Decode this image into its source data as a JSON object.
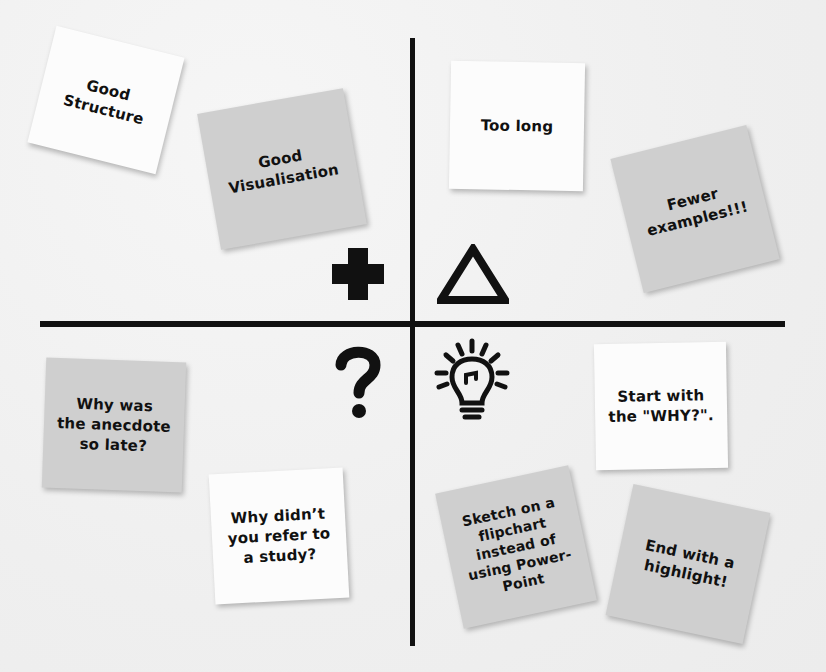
{
  "diagram": {
    "type": "retrospective-quadrant-board",
    "quadrants": [
      {
        "id": "plus",
        "symbol": "plus-icon",
        "notes": [
          {
            "text": "Good\nStructure",
            "color": "white"
          },
          {
            "text": "Good\nVisualisation",
            "color": "grey"
          }
        ]
      },
      {
        "id": "delta",
        "symbol": "triangle-delta-icon",
        "notes": [
          {
            "text": "Too long",
            "color": "white"
          },
          {
            "text": "Fewer\nexamples!!!",
            "color": "grey"
          }
        ]
      },
      {
        "id": "question",
        "symbol": "question-mark-icon",
        "notes": [
          {
            "text": "Why was\nthe anecdote\nso late?",
            "color": "grey"
          },
          {
            "text": "Why didn’t\nyou refer to\na study?",
            "color": "white"
          }
        ]
      },
      {
        "id": "idea",
        "symbol": "lightbulb-icon",
        "notes": [
          {
            "text": "Start with\nthe \"WHY?\".",
            "color": "white"
          },
          {
            "text": "Sketch on a\nflipchart\ninstead of\nusing Power-\nPoint",
            "color": "grey"
          },
          {
            "text": "End with a\nhighlight!",
            "color": "grey"
          }
        ]
      }
    ]
  },
  "colors": {
    "ink": "#111111",
    "note_white": "#fcfcfc",
    "note_grey": "#cfcfcf",
    "board": "#f0f0f0"
  }
}
